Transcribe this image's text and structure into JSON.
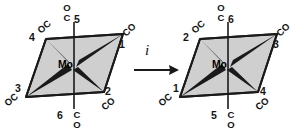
{
  "diagram": {
    "operation_label": "i",
    "metal_symbol": "Mo",
    "ligand_text": "CO",
    "ligand_text_reversed": "OC",
    "axial_atom_top": "O",
    "axial_atom_bottom": "C",
    "colors": {
      "line": "#1a1a1a",
      "face_fill": "#cfcfcf",
      "background": "#ffffff",
      "text": "#141414"
    },
    "left_structure": {
      "name": "starting-octahedron",
      "metal": "Mo",
      "vertices": [
        {
          "position": "upper-right",
          "number": "1",
          "ligand": "CO"
        },
        {
          "position": "lower-right",
          "number": "2",
          "ligand": "CO"
        },
        {
          "position": "lower-left",
          "number": "3",
          "ligand": "OC"
        },
        {
          "position": "upper-left",
          "number": "4",
          "ligand": "OC"
        },
        {
          "position": "axial-top",
          "number": "5",
          "ligand": "C",
          "ligand_outer": "O"
        },
        {
          "position": "axial-bottom",
          "number": "6",
          "ligand": "C",
          "ligand_outer": "O"
        }
      ]
    },
    "right_structure": {
      "name": "inverted-octahedron",
      "metal": "Mo",
      "vertices": [
        {
          "position": "lower-left",
          "number": "1",
          "ligand": "OC"
        },
        {
          "position": "upper-left",
          "number": "2",
          "ligand": "OC"
        },
        {
          "position": "upper-right",
          "number": "3",
          "ligand": "CO"
        },
        {
          "position": "lower-right",
          "number": "4",
          "ligand": "CO"
        },
        {
          "position": "axial-bottom",
          "number": "5",
          "ligand": "C",
          "ligand_outer": "O"
        },
        {
          "position": "axial-top",
          "number": "6",
          "ligand": "C",
          "ligand_outer": "O"
        }
      ]
    }
  }
}
